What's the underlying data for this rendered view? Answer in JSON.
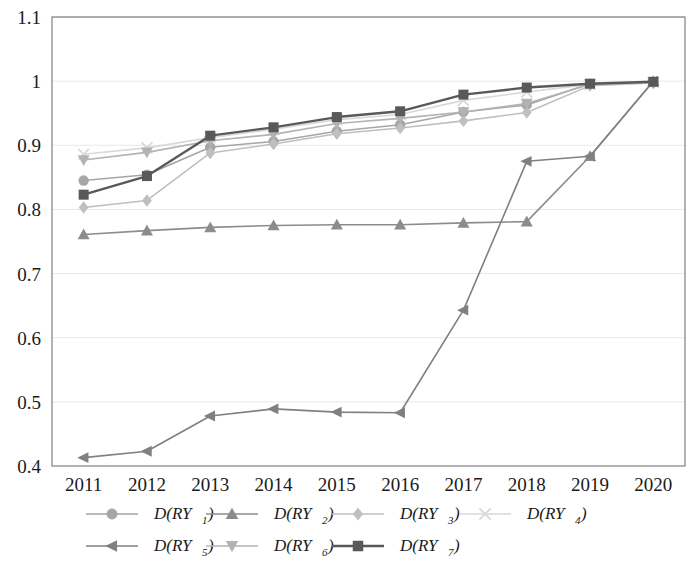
{
  "chart_data": {
    "type": "line",
    "title": "",
    "xlabel": "",
    "ylabel": "",
    "grid": true,
    "legend_position": "bottom",
    "categories": [
      "2011",
      "2012",
      "2013",
      "2014",
      "2015",
      "2016",
      "2017",
      "2018",
      "2019",
      "2020"
    ],
    "x": [
      2011,
      2012,
      2013,
      2014,
      2015,
      2016,
      2017,
      2018,
      2019,
      2020
    ],
    "ylim": [
      0.4,
      1.1
    ],
    "yticks": [
      0.4,
      0.5,
      0.6,
      0.7,
      0.8,
      0.9,
      1.0,
      1.1
    ],
    "ytick_labels": [
      "0.4",
      "0.5",
      "0.6",
      "0.7",
      "0.8",
      "0.9",
      "1",
      "1.1"
    ],
    "series": [
      {
        "name": "D(RY1)",
        "label_base": "D(RY",
        "label_sub": "1",
        "marker": "circle",
        "color": "#a6a6a6",
        "values": [
          0.845,
          0.854,
          0.897,
          0.906,
          0.922,
          0.932,
          0.952,
          0.963,
          0.996,
          0.998
        ]
      },
      {
        "name": "D(RY2)",
        "label_base": "D(RY",
        "label_sub": "2",
        "marker": "triangle-up",
        "color": "#8c8c8c",
        "values": [
          0.761,
          0.767,
          0.772,
          0.775,
          0.776,
          0.776,
          0.779,
          0.781,
          0.883,
          1.0
        ]
      },
      {
        "name": "D(RY3)",
        "label_base": "D(RY",
        "label_sub": "3",
        "marker": "diamond",
        "color": "#bfbfbf",
        "values": [
          0.803,
          0.814,
          0.888,
          0.902,
          0.918,
          0.927,
          0.938,
          0.951,
          0.993,
          0.997
        ]
      },
      {
        "name": "D(RY4)",
        "label_base": "D(RY",
        "label_sub": "4",
        "marker": "x",
        "color": "#d9d9d9",
        "values": [
          0.886,
          0.896,
          0.912,
          0.925,
          0.94,
          0.948,
          0.97,
          0.983,
          0.995,
          0.998
        ]
      },
      {
        "name": "D(RY5)",
        "label_base": "D(RY",
        "label_sub": "5",
        "marker": "triangle-left",
        "color": "#808080",
        "values": [
          0.413,
          0.423,
          0.478,
          0.489,
          0.484,
          0.483,
          0.643,
          0.875,
          0.883,
          1.0
        ]
      },
      {
        "name": "D(RY6)",
        "label_base": "D(RY",
        "label_sub": "6",
        "marker": "triangle-down",
        "color": "#b3b3b3",
        "values": [
          0.877,
          0.889,
          0.907,
          0.917,
          0.934,
          0.942,
          0.952,
          0.965,
          0.995,
          0.998
        ]
      },
      {
        "name": "D(RY7)",
        "label_base": "D(RY",
        "label_sub": "7",
        "marker": "square",
        "color": "#595959",
        "values": [
          0.823,
          0.852,
          0.915,
          0.928,
          0.944,
          0.953,
          0.979,
          0.99,
          0.996,
          0.999
        ]
      }
    ]
  },
  "axis": {
    "frame_color": "#808080",
    "grid_color": "#e8e8e8",
    "background": "#ffffff"
  },
  "legend": {
    "rows": [
      [
        "D(RY1)",
        "D(RY2)",
        "D(RY3)",
        "D(RY4)"
      ],
      [
        "D(RY5)",
        "D(RY6)",
        "D(RY7)"
      ]
    ]
  }
}
